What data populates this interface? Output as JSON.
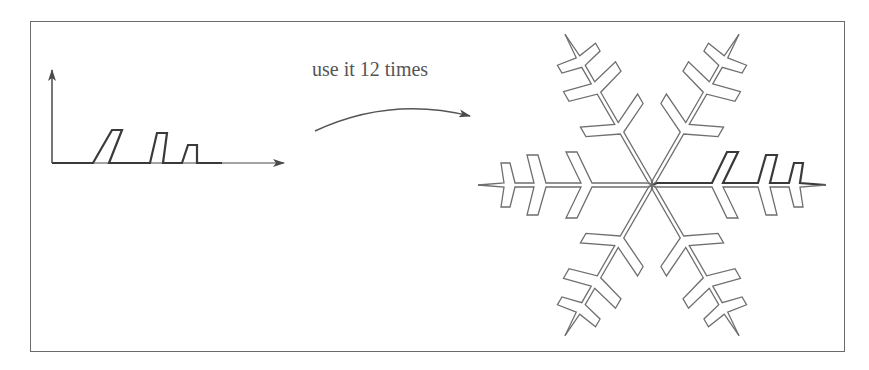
{
  "figure": {
    "caption": "use it 12 times",
    "generator": {
      "description": "Half-branch generator curve drawn on axes",
      "axes": {
        "origin": [
          52,
          163
        ],
        "x_end": [
          285,
          163
        ],
        "y_end": [
          52,
          68
        ]
      },
      "path_points": [
        [
          52,
          163
        ],
        [
          93,
          163
        ],
        [
          112,
          130
        ],
        [
          122,
          130
        ],
        [
          109,
          163
        ],
        [
          150,
          163
        ],
        [
          157,
          133
        ],
        [
          167,
          133
        ],
        [
          163,
          163
        ],
        [
          182,
          163
        ],
        [
          188,
          145
        ],
        [
          197,
          145
        ],
        [
          197,
          163
        ],
        [
          222,
          163
        ]
      ]
    },
    "snowflake": {
      "center": [
        652,
        185
      ],
      "copies": 12,
      "rotations_deg": [
        0,
        60,
        120,
        180,
        240,
        300
      ],
      "mirrored": true,
      "local_points": [
        [
          0,
          0
        ],
        [
          5,
          -2
        ],
        [
          60,
          -2
        ],
        [
          75,
          -33
        ],
        [
          86,
          -33
        ],
        [
          71,
          -2
        ],
        [
          106,
          -2
        ],
        [
          114,
          -30
        ],
        [
          125,
          -30
        ],
        [
          118,
          -2
        ],
        [
          137,
          -2
        ],
        [
          142,
          -22
        ],
        [
          151,
          -22
        ],
        [
          148,
          -2
        ],
        [
          174,
          0
        ]
      ],
      "highlight_copy": 0
    },
    "colors": {
      "stroke": "#6e6e6e",
      "highlight_stroke": "#3a3a3a",
      "frame": "#6b6b6b",
      "text": "#555555"
    }
  }
}
